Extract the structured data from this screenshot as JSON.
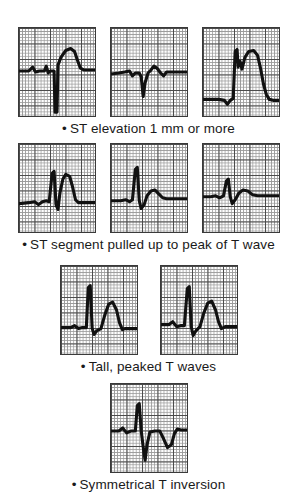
{
  "figure": {
    "background_color": "#ffffff",
    "trace_color": "#111111",
    "grid_fine_color": "#9a9a9a",
    "grid_bold_color": "#4a4a4a",
    "border_color": "#3a3a3a"
  },
  "sections": [
    {
      "id": "st-elevation",
      "caption": "ST elevation 1 mm or more",
      "bullet": "•",
      "strip_count": 3
    },
    {
      "id": "st-pulled-up",
      "caption": "ST segment pulled up to peak of T wave",
      "bullet": "•",
      "strip_count": 3
    },
    {
      "id": "tall-peaked-t",
      "caption": "Tall, peaked T waves",
      "bullet": "•",
      "strip_count": 2
    },
    {
      "id": "symmetrical-t-inversion",
      "caption": "Symmetrical T inversion",
      "bullet": "•",
      "strip_count": 1
    }
  ],
  "chart_data": {
    "type": "line",
    "xlabel": "",
    "ylabel": "",
    "grid": "ecg-graph-paper",
    "grid_small_mm": 1,
    "grid_large_mm": 5,
    "legend": "none",
    "strips": [
      {
        "section": "st-elevation",
        "index": 1,
        "label": "Marked ST elevation with deep Q/S wave and broad coved T",
        "path": "M 0,44 L 10,44 L 14,40 L 17,45 L 21,44 L 26,44 L 28,39 L 30,46 L 32,44 L 36,44 L 37,86 L 39,86 L 40,38 L 43,30 L 48,23 L 53,21 L 57,24 L 60,33 L 63,41 L 67,43 L 78,43"
      },
      {
        "section": "st-elevation",
        "index": 2,
        "label": "Flat baseline with small QS deflection and elevated coved ST-T",
        "path": "M 0,47 L 8,46 L 14,45 L 19,44 L 22,49 L 25,46 L 29,46 L 31,50 L 33,70 L 35,56 L 38,46 L 41,43 L 44,39 L 47,41 L 51,46 L 54,49 L 57,45 L 60,45 L 78,45"
      },
      {
        "section": "st-elevation",
        "index": 3,
        "label": "Tombstone ST elevation: tall R merging into dome-shaped ST-T",
        "path": "M 0,73 L 16,73 L 22,74 L 25,78 L 28,74 L 31,72 L 33,24 L 35,22 L 36,40 L 38,34 L 40,42 L 43,30 L 47,24 L 52,23 L 56,28 L 59,41 L 62,57 L 65,68 L 68,73 L 72,74 L 78,74"
      },
      {
        "section": "st-pulled-up",
        "index": 1,
        "label": "Baseline with R wave and ST segment pulled up into peaked T",
        "path": "M 0,61 L 10,60 L 16,59 L 20,62 L 24,59 L 28,58 L 31,59 L 34,30 L 36,28 L 38,62 L 40,67 L 42,50 L 45,36 L 48,31 L 52,33 L 55,44 L 58,57 L 61,60 L 65,60 L 78,60"
      },
      {
        "section": "st-pulled-up",
        "index": 2,
        "label": "Tall narrow R with ST segment rising into rounded T wave",
        "path": "M 0,58 L 10,58 L 15,57 L 19,59 L 22,57 L 25,26 L 27,24 L 29,58 L 31,66 L 34,62 L 37,53 L 41,48 L 45,47 L 49,51 L 53,55 L 57,56 L 62,56 L 78,56"
      },
      {
        "section": "st-pulled-up",
        "index": 3,
        "label": "Small complex with ST segment pulled up into low rounded T",
        "path": "M 0,54 L 8,54 L 13,53 L 17,55 L 21,53 L 24,38 L 26,36 L 28,54 L 30,61 L 33,57 L 37,50 L 41,47 L 46,48 L 51,52 L 56,53 L 62,53 L 78,53"
      },
      {
        "section": "tall-peaked-t",
        "index": 1,
        "label": "Tall peaked T wave following narrow QRS complex",
        "path": "M 0,63 L 10,63 L 14,61 L 18,64 L 22,63 L 26,63 L 28,22 L 30,20 L 32,64 L 34,70 L 37,66 L 41,64 L 45,50 L 49,39 L 53,37 L 57,45 L 60,58 L 63,65 L 66,64 L 78,64"
      },
      {
        "section": "tall-peaked-t",
        "index": 2,
        "label": "Tall peaked symmetric T wave with preceding upright R wave",
        "path": "M 0,60 L 8,60 L 12,57 L 16,62 L 20,61 L 24,61 L 27,23 L 29,21 L 31,62 L 33,71 L 36,66 L 40,62 L 44,48 L 48,38 L 52,36 L 56,45 L 59,57 L 62,64 L 66,62 L 78,62"
      },
      {
        "section": "symmetrical-t-inversion",
        "index": 1,
        "label": "Deeply inverted symmetrical T wave after QRS complex",
        "path": "M 0,48 L 8,48 L 12,45 L 16,50 L 21,48 L 25,48 L 27,22 L 29,20 L 31,48 L 33,64 L 35,78 L 37,62 L 40,49 L 45,48 L 50,48 L 54,56 L 58,65 L 62,62 L 65,51 L 68,46 L 72,47 L 78,47"
      }
    ]
  }
}
